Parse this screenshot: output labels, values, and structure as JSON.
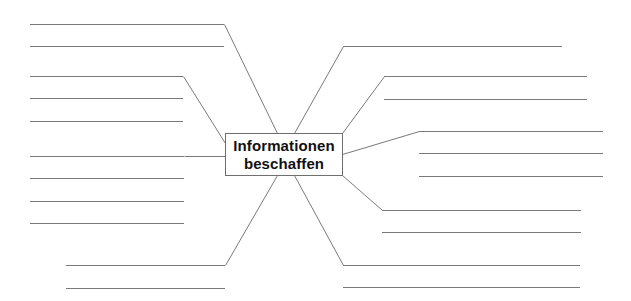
{
  "diagram": {
    "type": "mind-map",
    "center": {
      "line1": "Informationen",
      "line2": "beschaffen"
    },
    "branches": [
      {
        "name": "top-left",
        "connector": [
          [
            277,
            133
          ],
          [
            224,
            24
          ]
        ],
        "lines": [
          {
            "y": 24,
            "x1": 30,
            "x2": 224
          },
          {
            "y": 46,
            "x1": 30,
            "x2": 224
          }
        ]
      },
      {
        "name": "upper-left",
        "connector": [
          [
            225,
            143
          ],
          [
            183,
            76
          ]
        ],
        "lines": [
          {
            "y": 76,
            "x1": 30,
            "x2": 183
          },
          {
            "y": 98,
            "x1": 30,
            "x2": 183
          },
          {
            "y": 121,
            "x1": 30,
            "x2": 183
          }
        ]
      },
      {
        "name": "middle-left",
        "connector": [
          [
            225,
            156
          ],
          [
            184,
            156
          ]
        ],
        "lines": [
          {
            "y": 156,
            "x1": 30,
            "x2": 184
          },
          {
            "y": 178,
            "x1": 30,
            "x2": 184
          },
          {
            "y": 201,
            "x1": 30,
            "x2": 184
          },
          {
            "y": 223,
            "x1": 30,
            "x2": 184
          }
        ]
      },
      {
        "name": "bottom-left",
        "connector": [
          [
            277,
            175
          ],
          [
            225,
            265
          ]
        ],
        "lines": [
          {
            "y": 265,
            "x1": 66,
            "x2": 225
          },
          {
            "y": 288,
            "x1": 66,
            "x2": 225
          }
        ]
      },
      {
        "name": "top-right",
        "connector": [
          [
            294,
            133
          ],
          [
            343,
            46
          ]
        ],
        "lines": [
          {
            "y": 46,
            "x1": 343,
            "x2": 562
          }
        ]
      },
      {
        "name": "upper-right",
        "connector": [
          [
            342,
            133
          ],
          [
            384,
            76
          ]
        ],
        "lines": [
          {
            "y": 76,
            "x1": 384,
            "x2": 587
          },
          {
            "y": 99,
            "x1": 384,
            "x2": 587
          }
        ]
      },
      {
        "name": "middle-right",
        "connector": [
          [
            342,
            154
          ],
          [
            419,
            131
          ]
        ],
        "lines": [
          {
            "y": 131,
            "x1": 419,
            "x2": 603
          },
          {
            "y": 153,
            "x1": 419,
            "x2": 603
          },
          {
            "y": 176,
            "x1": 419,
            "x2": 603
          }
        ]
      },
      {
        "name": "lower-right",
        "connector": [
          [
            342,
            175
          ],
          [
            382,
            210
          ]
        ],
        "lines": [
          {
            "y": 210,
            "x1": 382,
            "x2": 581
          },
          {
            "y": 232,
            "x1": 382,
            "x2": 581
          }
        ]
      },
      {
        "name": "bottom-right",
        "connector": [
          [
            294,
            175
          ],
          [
            343,
            265
          ]
        ],
        "lines": [
          {
            "y": 265,
            "x1": 343,
            "x2": 580
          },
          {
            "y": 287,
            "x1": 343,
            "x2": 580
          }
        ]
      }
    ],
    "colors": {
      "line": "#7a7a7a",
      "box_border": "#6f6f6f",
      "text": "#111111",
      "background": "#ffffff"
    }
  }
}
